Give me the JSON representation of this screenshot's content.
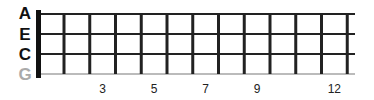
{
  "diagram": {
    "type": "ukulele-fretboard",
    "strings": [
      {
        "name": "A",
        "color": "#111111"
      },
      {
        "name": "E",
        "color": "#111111"
      },
      {
        "name": "C",
        "color": "#111111"
      },
      {
        "name": "G",
        "color": "#aaaaaa"
      }
    ],
    "fret_count": 12,
    "fret_markers": [
      "3",
      "5",
      "7",
      "9",
      "12"
    ],
    "marker_frets": [
      3,
      5,
      7,
      9,
      12
    ],
    "colors": {
      "line": "#222222",
      "nut": "#111111",
      "low_string": "#bbbbbb"
    }
  }
}
